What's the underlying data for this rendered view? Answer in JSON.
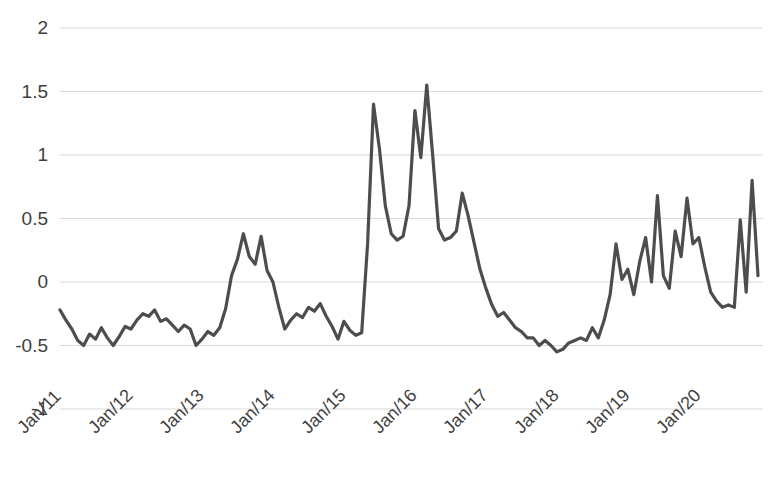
{
  "chart_data": {
    "type": "line",
    "title": "",
    "subtitle": "",
    "xlabel": "",
    "ylabel": "",
    "ylim": [
      -1,
      2
    ],
    "yticks": [
      2,
      1.5,
      1,
      0.5,
      0,
      -0.5,
      -1
    ],
    "ytick_labels": [
      "2",
      "1.5",
      "1",
      "0.5",
      "0",
      "-0.5",
      "-1"
    ],
    "xtick_labels": [
      "Jan/11",
      "Jan/12",
      "Jan/13",
      "Jan/14",
      "Jan/15",
      "Jan/16",
      "Jan/17",
      "Jan/18",
      "Jan/19",
      "Jan/20"
    ],
    "xtick_index": [
      0,
      12,
      24,
      36,
      48,
      60,
      72,
      84,
      96,
      108
    ],
    "grid": true,
    "grid_axis": "y",
    "legend": false,
    "legend_position": "none",
    "annotations": [],
    "line_color": "#4d4d4d",
    "line_width": 3.2,
    "grid_color": "#d9d9d9",
    "text_color": "#3f3f3f",
    "background_color": "#ffffff",
    "x_start": "Jan/11",
    "x_end": "Nov/20",
    "x_frequency": "monthly",
    "n_points": 119,
    "series": [
      {
        "name": "series-1",
        "values": [
          -0.22,
          -0.3,
          -0.37,
          -0.46,
          -0.5,
          -0.41,
          -0.45,
          -0.36,
          -0.44,
          -0.5,
          -0.43,
          -0.35,
          -0.37,
          -0.3,
          -0.25,
          -0.27,
          -0.22,
          -0.31,
          -0.29,
          -0.34,
          -0.39,
          -0.34,
          -0.37,
          -0.5,
          -0.45,
          -0.39,
          -0.42,
          -0.36,
          -0.21,
          0.05,
          0.18,
          0.38,
          0.2,
          0.14,
          0.36,
          0.09,
          0.0,
          -0.2,
          -0.37,
          -0.3,
          -0.25,
          -0.28,
          -0.2,
          -0.23,
          -0.17,
          -0.27,
          -0.35,
          -0.45,
          -0.31,
          -0.38,
          -0.42,
          -0.4,
          0.3,
          1.4,
          1.05,
          0.6,
          0.38,
          0.33,
          0.36,
          0.6,
          1.35,
          0.98,
          1.55,
          1.0,
          0.42,
          0.33,
          0.35,
          0.4,
          0.7,
          0.52,
          0.31,
          0.1,
          -0.05,
          -0.18,
          -0.27,
          -0.24,
          -0.3,
          -0.36,
          -0.39,
          -0.44,
          -0.44,
          -0.5,
          -0.46,
          -0.5,
          -0.55,
          -0.53,
          -0.48,
          -0.46,
          -0.44,
          -0.46,
          -0.36,
          -0.44,
          -0.3,
          -0.1,
          0.3,
          0.02,
          0.1,
          -0.1,
          0.16,
          0.35,
          0.0,
          0.68,
          0.05,
          -0.05,
          0.4,
          0.2,
          0.66,
          0.3,
          0.35,
          0.12,
          -0.08,
          -0.15,
          -0.2,
          -0.18,
          -0.2,
          0.49,
          -0.08,
          0.8,
          0.05
        ]
      }
    ]
  },
  "axes": {
    "y_axis_name": "value-axis",
    "x_axis_name": "time-axis"
  }
}
